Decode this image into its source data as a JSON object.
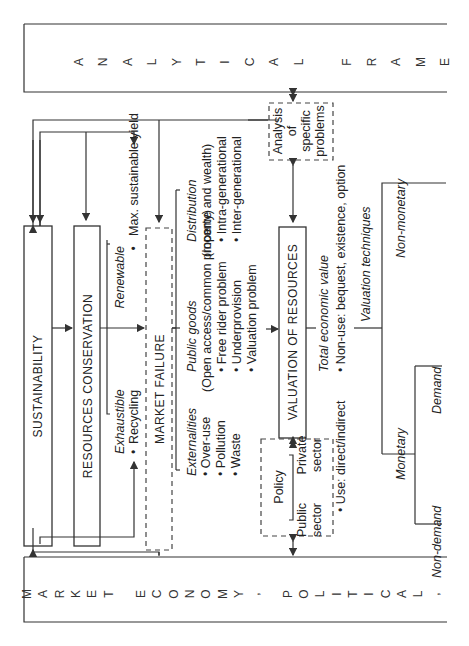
{
  "frame_top": {
    "letters": [
      "A",
      "N",
      "A",
      "L",
      "Y",
      "T",
      "I",
      "C",
      "A",
      "L",
      " ",
      "F",
      "R",
      "A",
      "M",
      "E"
    ]
  },
  "frame_bottom": {
    "letters": [
      "M",
      "A",
      "R",
      "K",
      "E",
      "T",
      " ",
      "E",
      "C",
      "O",
      "N",
      "O",
      "M",
      "Y",
      ",",
      " ",
      "P",
      "O",
      "L",
      "I",
      "T",
      "I",
      "C",
      "A",
      "L",
      ","
    ]
  },
  "boxes": {
    "sustainability": "SUSTAINABILITY",
    "resources_conservation": "RESOURCES CONSERVATION",
    "market_failure": "MARKET FAILURE",
    "valuation_of_resources": "VALUATION OF RESOURCES",
    "analysis": [
      "Analysis",
      "of",
      "specific",
      "problems"
    ],
    "policy": {
      "title": "Policy",
      "public": [
        "Public",
        "sector"
      ],
      "private": [
        "Private",
        "sector"
      ]
    }
  },
  "resources": {
    "renewable": {
      "label": "Renewable",
      "item": "Max. sustainable yield"
    },
    "exhaustible": {
      "label": "Exhaustible",
      "item": "Recycling"
    }
  },
  "market_failure_branches": {
    "externalities": {
      "label": "Externalities",
      "items": [
        "Over-use",
        "Pollution",
        "Waste"
      ]
    },
    "public_goods": {
      "label": "Public goods",
      "subtitle": "(Open access/common property)",
      "items": [
        "Free rider problem",
        "Underprovision",
        "Valuation problem"
      ]
    },
    "distribution": {
      "label": "Distribution",
      "subtitle": "(Income and wealth)",
      "items": [
        "Intra-generational",
        "Inter-generational"
      ]
    }
  },
  "valuation": {
    "total_economic_value": {
      "label": "Total economic value",
      "use": "Use: direct/indirect",
      "non_use": "Non-use: bequest, existence, option"
    },
    "valuation_techniques": {
      "label": "Valuation techniques",
      "monetary": "Monetary",
      "non_monetary": "Non-monetary",
      "demand": "Demand",
      "non_demand": "Non-demand"
    }
  }
}
